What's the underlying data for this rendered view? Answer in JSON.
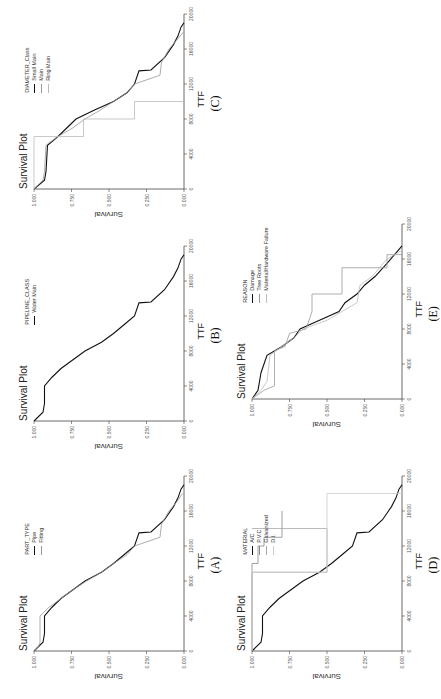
{
  "figure": {
    "orientation": "rotated 90deg counter-clockwise",
    "panels": [
      {
        "id": "A",
        "label": "(A)",
        "title": "Survival Plot",
        "xlabel": "TTF",
        "ylabel": "Survival",
        "legend_title": "PART_TYPE",
        "legend": [
          "Pipe",
          "Fitting"
        ]
      },
      {
        "id": "B",
        "label": "(B)",
        "title": "Survival Plot",
        "xlabel": "TTF",
        "ylabel": "Survival",
        "legend_title": "PIPELINE_CLASS",
        "legend": [
          "Water Main"
        ]
      },
      {
        "id": "C",
        "label": "(C)",
        "title": "Survival Plot",
        "xlabel": "TTF",
        "ylabel": "Survival",
        "legend_title": "DIAMETER_Class",
        "legend": [
          "Small Main",
          "Main",
          "Ring Main"
        ]
      },
      {
        "id": "D",
        "label": "(D)",
        "title": "Survival Plot",
        "xlabel": "TTF",
        "ylabel": "Survival",
        "legend_title": "MATERIAL",
        "legend": [
          "A/C",
          "P.V.C",
          "Galvanized",
          "D.I."
        ]
      },
      {
        "id": "E",
        "label": "(E)",
        "title": "Survival Plot",
        "xlabel": "TTF",
        "ylabel": "Survival",
        "legend_title": "REASON",
        "legend": [
          "Damage",
          "Tree Roots",
          "Material/Hardware Failure"
        ]
      }
    ]
  },
  "chart_data": [
    {
      "type": "line",
      "panel": "(A)",
      "title": "Survival Plot",
      "xlabel": "TTF",
      "ylabel": "Survival",
      "xlim": [
        0,
        20000
      ],
      "ylim": [
        0,
        1
      ],
      "xticks": [
        0,
        4000,
        8000,
        12000,
        16000,
        20000
      ],
      "yticks": [
        0,
        0.25,
        0.5,
        0.75,
        1.0
      ],
      "legend_title": "PART_TYPE",
      "series": [
        {
          "name": "Pipe",
          "x": [
            0,
            1000,
            2000,
            4000,
            5000,
            6000,
            7000,
            8000,
            9000,
            10000,
            11000,
            12000,
            13500,
            13600,
            15000,
            16500,
            17500,
            18500,
            19000
          ],
          "values": [
            1.0,
            0.94,
            0.93,
            0.93,
            0.88,
            0.82,
            0.74,
            0.66,
            0.55,
            0.47,
            0.4,
            0.33,
            0.3,
            0.22,
            0.13,
            0.07,
            0.04,
            0.02,
            0.0
          ]
        },
        {
          "name": "Fitting",
          "x": [
            0,
            500,
            1000,
            4000,
            5000,
            6000,
            7000,
            8000,
            9000,
            10000,
            11000,
            12000,
            13000,
            14500,
            16000,
            17000,
            18000
          ],
          "values": [
            1.0,
            0.97,
            0.96,
            0.96,
            0.9,
            0.82,
            0.74,
            0.65,
            0.55,
            0.47,
            0.38,
            0.33,
            0.16,
            0.15,
            0.1,
            0.05,
            0.01
          ]
        }
      ]
    },
    {
      "type": "line",
      "panel": "(B)",
      "title": "Survival Plot",
      "xlabel": "TTF",
      "ylabel": "Survival",
      "xlim": [
        0,
        20000
      ],
      "ylim": [
        0,
        1
      ],
      "xticks": [
        0,
        4000,
        8000,
        12000,
        16000,
        20000
      ],
      "yticks": [
        0,
        0.25,
        0.5,
        0.75,
        1.0
      ],
      "legend_title": "PIPELINE_CLASS",
      "series": [
        {
          "name": "Water Main",
          "x": [
            0,
            1000,
            2000,
            4000,
            5000,
            6000,
            7000,
            8000,
            9000,
            10000,
            11000,
            12000,
            13500,
            13600,
            15000,
            16500,
            17500,
            18500,
            19000
          ],
          "values": [
            1.0,
            0.94,
            0.93,
            0.93,
            0.88,
            0.82,
            0.74,
            0.66,
            0.55,
            0.47,
            0.4,
            0.33,
            0.3,
            0.22,
            0.13,
            0.07,
            0.04,
            0.02,
            0.0
          ]
        }
      ]
    },
    {
      "type": "line",
      "panel": "(C)",
      "title": "Survival Plot",
      "xlabel": "TTF",
      "ylabel": "Survival",
      "xlim": [
        0,
        20000
      ],
      "ylim": [
        0,
        1
      ],
      "xticks": [
        0,
        4000,
        8000,
        12000,
        16000,
        20000
      ],
      "yticks": [
        0,
        0.25,
        0.5,
        0.75,
        1.0
      ],
      "legend_title": "DIAMETER_Class",
      "series": [
        {
          "name": "Small Main",
          "x": [
            0,
            1000,
            2000,
            5000,
            6000,
            7000,
            8000,
            9000,
            10000,
            11000,
            12000,
            13500,
            13600,
            15000,
            16500,
            17500,
            18500,
            19000
          ],
          "values": [
            1.0,
            0.93,
            0.92,
            0.91,
            0.84,
            0.78,
            0.72,
            0.6,
            0.47,
            0.38,
            0.33,
            0.3,
            0.22,
            0.13,
            0.07,
            0.04,
            0.02,
            0.0
          ]
        },
        {
          "name": "Main",
          "x": [
            0,
            1000,
            2000,
            5000,
            6000,
            7000,
            8000,
            9000,
            10000,
            11000,
            12000,
            13000,
            14500,
            16000,
            17000,
            18000
          ],
          "values": [
            1.0,
            0.94,
            0.93,
            0.92,
            0.84,
            0.74,
            0.66,
            0.56,
            0.47,
            0.38,
            0.33,
            0.16,
            0.15,
            0.1,
            0.05,
            0.0
          ]
        },
        {
          "name": "Ring Main",
          "x": [
            0,
            6000,
            6000,
            8000,
            8000,
            10000,
            10000
          ],
          "values": [
            1.0,
            1.0,
            0.67,
            0.67,
            0.33,
            0.33,
            0.0
          ]
        }
      ]
    },
    {
      "type": "line",
      "panel": "(D)",
      "title": "Survival Plot",
      "xlabel": "TTF",
      "ylabel": "Survival",
      "xlim": [
        0,
        20000
      ],
      "ylim": [
        0,
        1
      ],
      "xticks": [
        0,
        4000,
        8000,
        12000,
        16000,
        20000
      ],
      "yticks": [
        0,
        0.25,
        0.5,
        0.75,
        1.0
      ],
      "legend_title": "MATERIAL",
      "series": [
        {
          "name": "A/C",
          "x": [
            0,
            1000,
            2000,
            4000,
            5000,
            6000,
            7000,
            8000,
            9000,
            10000,
            11000,
            12000,
            13500,
            13600,
            15000,
            16500,
            17500,
            18500,
            19000
          ],
          "values": [
            1.0,
            0.94,
            0.93,
            0.93,
            0.88,
            0.82,
            0.74,
            0.66,
            0.55,
            0.47,
            0.4,
            0.33,
            0.3,
            0.22,
            0.13,
            0.07,
            0.04,
            0.02,
            0.0
          ]
        },
        {
          "name": "P.V.C",
          "x": [
            0,
            10000,
            10000,
            12000,
            12000,
            13000,
            13000,
            16000
          ],
          "values": [
            1.0,
            1.0,
            0.96,
            0.96,
            0.92,
            0.92,
            0.8,
            0.8
          ]
        },
        {
          "name": "Galvanized",
          "x": [
            0,
            9000,
            9000,
            14000,
            14000
          ],
          "values": [
            1.0,
            1.0,
            0.5,
            0.5,
            1.0
          ]
        },
        {
          "name": "D.I.",
          "x": [
            0,
            9000,
            9000,
            18000,
            18000
          ],
          "values": [
            1.0,
            1.0,
            0.5,
            0.5,
            0.0
          ]
        }
      ]
    },
    {
      "type": "line",
      "panel": "(E)",
      "title": "Survival Plot",
      "xlabel": "TTF",
      "ylabel": "Survival",
      "xlim": [
        0,
        20000
      ],
      "ylim": [
        0,
        1
      ],
      "xticks": [
        0,
        4000,
        8000,
        12000,
        16000,
        20000
      ],
      "yticks": [
        0,
        0.25,
        0.5,
        0.75,
        1.0
      ],
      "legend_title": "REASON",
      "series": [
        {
          "name": "Damage",
          "x": [
            0,
            1000,
            3000,
            5000,
            6000,
            7000,
            8000,
            9000,
            10000,
            11000,
            12000,
            13000,
            14000,
            15500,
            16500,
            17500
          ],
          "values": [
            1.0,
            0.96,
            0.94,
            0.9,
            0.8,
            0.72,
            0.68,
            0.55,
            0.42,
            0.38,
            0.3,
            0.25,
            0.18,
            0.1,
            0.05,
            0.0
          ]
        },
        {
          "name": "Tree Roots",
          "x": [
            0,
            1000,
            1500,
            5500,
            6000,
            7500,
            8000,
            10000,
            12000,
            12000,
            15000,
            15000,
            16500,
            16500
          ],
          "values": [
            1.0,
            0.92,
            0.85,
            0.85,
            0.78,
            0.75,
            0.64,
            0.6,
            0.6,
            0.4,
            0.4,
            0.1,
            0.1,
            0.0
          ]
        },
        {
          "name": "Material/Hardware Failure",
          "x": [
            0,
            1000,
            2000,
            5000,
            6000,
            7000,
            8000,
            9000,
            10000,
            11000,
            13000,
            14000,
            16000,
            16500,
            17000
          ],
          "values": [
            1.0,
            0.94,
            0.9,
            0.88,
            0.8,
            0.72,
            0.66,
            0.5,
            0.4,
            0.3,
            0.28,
            0.2,
            0.1,
            0.05,
            0.0
          ]
        }
      ]
    }
  ]
}
